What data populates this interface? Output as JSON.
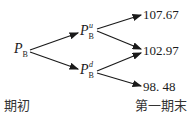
{
  "diagram": {
    "type": "binomial-tree",
    "root": {
      "label": "P",
      "subscript": "B"
    },
    "up_node": {
      "label": "P",
      "subscript": "B",
      "superscript": "u"
    },
    "down_node": {
      "label": "P",
      "subscript": "B",
      "superscript": "d"
    },
    "leaves": [
      "107.67",
      "102.97",
      "98. 48"
    ],
    "axis_labels": {
      "start": "期初",
      "end": "第一期末"
    }
  }
}
